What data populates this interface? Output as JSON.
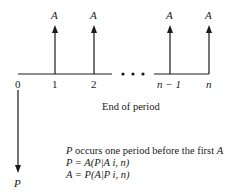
{
  "diagram": {
    "type": "cash-flow-diagram",
    "periods": [
      {
        "label": "0",
        "x": 18
      },
      {
        "label": "1",
        "x": 55
      },
      {
        "label": "2",
        "x": 94
      },
      {
        "label": "n − 1",
        "x": 170
      },
      {
        "label": "n",
        "x": 209
      }
    ],
    "receipts": [
      {
        "label": "A",
        "period": "1"
      },
      {
        "label": "A",
        "period": "2"
      },
      {
        "label": "A",
        "period": "n − 1"
      },
      {
        "label": "A",
        "period": "n"
      }
    ],
    "ellipsis": "• • •",
    "payment": {
      "label": "P",
      "period": "0"
    },
    "axis_caption": "End of period",
    "notes": {
      "line1_var": "P",
      "line1_text": " occurs one period before the first ",
      "line1_end": "A",
      "line2": "P = A(P|A i, n)",
      "line3": "A = P(A|P i, n)"
    }
  }
}
